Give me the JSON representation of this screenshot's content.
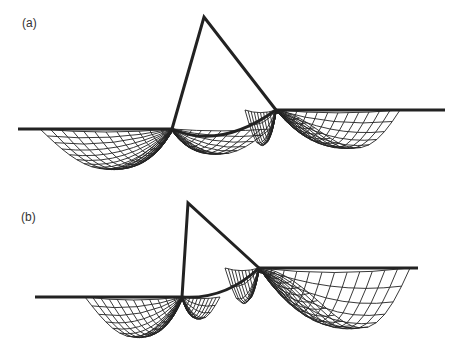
{
  "panels": [
    {
      "label": "(a)",
      "description": "Mesh with flat left surface, triangle apex, arc contact and fanned grid below"
    },
    {
      "label": "(b)",
      "description": "Mesh with vertical left edge of triangle and raised right surface"
    }
  ],
  "colors": {
    "line": "#222222",
    "background": "#ffffff"
  }
}
